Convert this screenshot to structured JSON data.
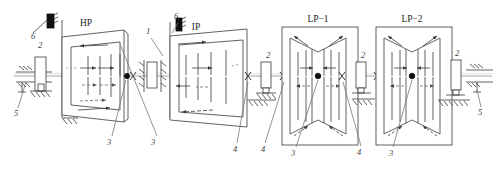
{
  "diagram": {
    "background": "#ffffff",
    "line_color": "#3a3a3a",
    "axis_color": "#9a9a9a",
    "fill_black": "#111111"
  },
  "cylinders": [
    {
      "id": "hp",
      "label": "HP",
      "shape": "trapezoid-right",
      "x": 97,
      "y": 22
    },
    {
      "id": "ip",
      "label": "IP",
      "shape": "trapezoid-right",
      "x": 203,
      "y": 25
    },
    {
      "id": "lp1",
      "label": "LP−1",
      "shape": "double-flow",
      "x": 318,
      "y": 20
    },
    {
      "id": "lp2",
      "label": "LP−2",
      "shape": "double-flow",
      "x": 412,
      "y": 20
    }
  ],
  "callouts": [
    {
      "key": "c6a",
      "text": "6",
      "x": 34,
      "y": 36
    },
    {
      "key": "c2a",
      "text": "2",
      "x": 41,
      "y": 45
    },
    {
      "key": "c5a",
      "text": "5",
      "x": 12,
      "y": 113
    },
    {
      "key": "c3a",
      "text": "3",
      "x": 108,
      "y": 141
    },
    {
      "key": "c1",
      "text": "1",
      "x": 148,
      "y": 31
    },
    {
      "key": "c6b",
      "text": "6",
      "x": 175,
      "y": 17
    },
    {
      "key": "c3b",
      "text": "3",
      "x": 152,
      "y": 141
    },
    {
      "key": "c4a",
      "text": "4",
      "x": 234,
      "y": 148
    },
    {
      "key": "c4b",
      "text": "4",
      "x": 262,
      "y": 148
    },
    {
      "key": "c2b",
      "text": "2",
      "x": 268,
      "y": 64
    },
    {
      "key": "c3c",
      "text": "3",
      "x": 292,
      "y": 152
    },
    {
      "key": "c2c",
      "text": "2",
      "x": 363,
      "y": 64
    },
    {
      "key": "c4c",
      "text": "4",
      "x": 358,
      "y": 151
    },
    {
      "key": "c3d",
      "text": "3",
      "x": 390,
      "y": 152
    },
    {
      "key": "c2d",
      "text": "2",
      "x": 458,
      "y": 62
    },
    {
      "key": "c5b",
      "text": "5",
      "x": 479,
      "y": 112
    }
  ],
  "legend_keys": {
    "1": "shaft-end / generator side marker",
    "2": "journal bearing pedestal",
    "3": "rotor blading",
    "4": "shaft coupling",
    "5": "foundation support",
    "6": "exciter block"
  },
  "bearings": [
    {
      "id": "b-left",
      "x": 40,
      "y": 60
    },
    {
      "id": "b-mid1",
      "x": 152,
      "y": 60
    },
    {
      "id": "b-lp1r",
      "x": 266,
      "y": 60
    },
    {
      "id": "b-lp2r",
      "x": 361,
      "y": 60
    },
    {
      "id": "b-right",
      "x": 456,
      "y": 60
    }
  ],
  "couplings": [
    {
      "id": "cpl-1",
      "x": 133,
      "y": 76
    },
    {
      "id": "cpl-2",
      "x": 248,
      "y": 76
    },
    {
      "id": "cpl-3",
      "x": 283,
      "y": 76
    },
    {
      "id": "cpl-4",
      "x": 342,
      "y": 76
    },
    {
      "id": "cpl-5",
      "x": 377,
      "y": 76
    }
  ],
  "axis": {
    "y": 76,
    "x1": 14,
    "x2": 492
  }
}
